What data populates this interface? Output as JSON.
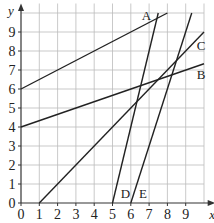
{
  "chart_data": {
    "type": "line",
    "title": "",
    "xlabel": "x",
    "ylabel": "y",
    "xlim": [
      0,
      10
    ],
    "ylim": [
      0,
      10
    ],
    "grid": true,
    "x_ticks": [
      "0",
      "1",
      "2",
      "3",
      "4",
      "5",
      "6",
      "7",
      "8",
      "9"
    ],
    "y_ticks": [
      "0",
      "1",
      "2",
      "3",
      "4",
      "5",
      "6",
      "7",
      "8",
      "9"
    ],
    "series": [
      {
        "name": "A",
        "equation": "y = x/2 + 6",
        "points": [
          [
            0,
            6
          ],
          [
            8,
            10
          ]
        ]
      },
      {
        "name": "B",
        "equation": "y = x/3 + 4",
        "points": [
          [
            0,
            4
          ],
          [
            10,
            7.33
          ]
        ]
      },
      {
        "name": "C",
        "equation": "y = x - 1",
        "points": [
          [
            1,
            0
          ],
          [
            10,
            9
          ]
        ]
      },
      {
        "name": "D",
        "equation": "y = 4(x - 5)",
        "points": [
          [
            5,
            0
          ],
          [
            7.5,
            10
          ]
        ]
      },
      {
        "name": "E",
        "equation": "y = 3(x - 6)",
        "points": [
          [
            6,
            0
          ],
          [
            9.33,
            10
          ]
        ]
      }
    ]
  }
}
